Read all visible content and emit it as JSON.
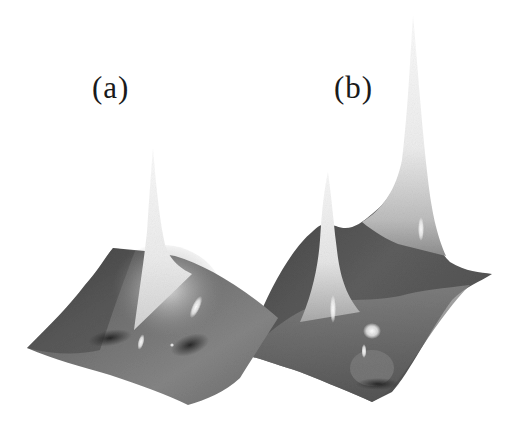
{
  "figure": {
    "panels": [
      {
        "id": "a",
        "label": "(a)",
        "description": "3D surface with a single sharp central peak",
        "peaks": 1
      },
      {
        "id": "b",
        "label": "(b)",
        "description": "3D surface with two sharp peaks, one taller than the other",
        "peaks": 2
      }
    ],
    "colors": {
      "background": "#ffffff",
      "surface_dark": "#3a3a3a",
      "surface_mid": "#7a7a7a",
      "peak_light": "#f2f2f2",
      "label": "#1a1a1a"
    }
  }
}
